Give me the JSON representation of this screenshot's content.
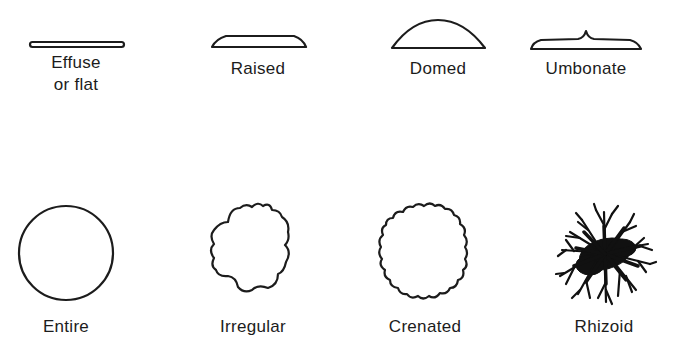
{
  "figure": {
    "elevation": {
      "items": [
        {
          "id": "effuse",
          "label_line1": "Effuse",
          "label_line2": "or flat"
        },
        {
          "id": "raised",
          "label": "Raised"
        },
        {
          "id": "domed",
          "label": "Domed"
        },
        {
          "id": "umbonate",
          "label": "Umbonate"
        }
      ]
    },
    "form": {
      "items": [
        {
          "id": "entire",
          "label": "Entire"
        },
        {
          "id": "irregular",
          "label": "Irregular"
        },
        {
          "id": "crenated",
          "label": "Crenated"
        },
        {
          "id": "rhizoid",
          "label": "Rhizoid"
        }
      ]
    },
    "colors": {
      "stroke": "#1c1c1c",
      "background": "#ffffff"
    }
  }
}
